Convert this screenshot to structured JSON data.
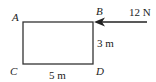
{
  "diagram": {
    "type": "force-diagram",
    "vertices": {
      "A": {
        "label": "A"
      },
      "B": {
        "label": "B"
      },
      "C": {
        "label": "C"
      },
      "D": {
        "label": "D"
      }
    },
    "dimensions": {
      "height_label": "3 m",
      "width_label": "5 m"
    },
    "force": {
      "magnitude_label": "12 N",
      "applied_at": "B",
      "direction": "left"
    },
    "colors": {
      "stroke": "#222222",
      "background": "#ffffff"
    }
  }
}
